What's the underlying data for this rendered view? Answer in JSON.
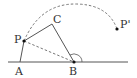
{
  "diagram": {
    "type": "geometry",
    "points": {
      "A": {
        "label": "A",
        "x": 20,
        "y": 62
      },
      "B": {
        "label": "B",
        "x": 74,
        "y": 62
      },
      "C": {
        "label": "C",
        "x": 52,
        "y": 24
      },
      "P": {
        "label": "P",
        "x": 24,
        "y": 41
      },
      "P_prime": {
        "label": "P'",
        "x": 117,
        "y": 29
      }
    },
    "segments": [
      {
        "from": "A",
        "to": "P",
        "style": "solid"
      },
      {
        "from": "P",
        "to": "C",
        "style": "solid"
      },
      {
        "from": "C",
        "to": "B",
        "style": "solid"
      },
      {
        "from": "P",
        "to": "B",
        "style": "dashed"
      }
    ],
    "baseline": {
      "label": "line AB",
      "style": "solid"
    },
    "arc": {
      "from": "P",
      "to": "P'",
      "style": "dashed",
      "description": "rotation path of P about B"
    },
    "angle_mark": {
      "at": "B",
      "description": "angle arc at B"
    },
    "colors": {
      "line": "#555555",
      "dashed": "#666666",
      "point": "#111111",
      "label": "#333333"
    }
  }
}
